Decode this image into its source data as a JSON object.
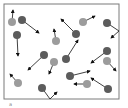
{
  "diagram": {
    "box": {
      "x": 4,
      "y": 4,
      "width": 115,
      "height": 95,
      "stroke": "#7a7a7a"
    },
    "colors": {
      "light_particle": "#9c9c9c",
      "dark_particle": "#5c5c5c",
      "arrow": "#111111"
    },
    "particle_radius": 4,
    "particles": [
      {
        "type": "light",
        "x": 12,
        "y": 22,
        "path": [
          [
            12,
            22
          ],
          [
            13,
            10
          ]
        ]
      },
      {
        "type": "dark",
        "x": 22,
        "y": 20,
        "path": [
          [
            22,
            20
          ],
          [
            39,
            33
          ]
        ]
      },
      {
        "type": "dark",
        "x": 17,
        "y": 35,
        "path": [
          [
            17,
            35
          ],
          [
            18,
            56
          ]
        ]
      },
      {
        "type": "light",
        "x": 56,
        "y": 41,
        "path": [
          [
            56,
            41
          ],
          [
            54,
            29
          ]
        ]
      },
      {
        "type": "light",
        "x": 83,
        "y": 22,
        "path": [
          [
            83,
            22
          ],
          [
            95,
            16
          ]
        ]
      },
      {
        "type": "dark",
        "x": 76,
        "y": 34,
        "path": [
          [
            76,
            34
          ],
          [
            61,
            19
          ]
        ]
      },
      {
        "type": "dark",
        "x": 107,
        "y": 23,
        "path": [
          [
            107,
            23
          ],
          [
            119,
            31
          ],
          [
            111,
            38
          ]
        ]
      },
      {
        "type": "dark",
        "x": 44,
        "y": 55,
        "path": [
          [
            44,
            55
          ],
          [
            28,
            70
          ]
        ]
      },
      {
        "type": "dark",
        "x": 66,
        "y": 59,
        "path": [
          [
            66,
            59
          ],
          [
            78,
            40
          ]
        ]
      },
      {
        "type": "light",
        "x": 54,
        "y": 62,
        "path": [
          [
            54,
            62
          ],
          [
            49,
            74
          ]
        ]
      },
      {
        "type": "dark",
        "x": 107,
        "y": 51,
        "path": [
          [
            107,
            51
          ],
          [
            91,
            63
          ]
        ]
      },
      {
        "type": "light",
        "x": 107,
        "y": 61,
        "path": [
          [
            107,
            61
          ],
          [
            116,
            71
          ]
        ]
      },
      {
        "type": "light",
        "x": 18,
        "y": 83,
        "path": [
          [
            18,
            83
          ],
          [
            10,
            74
          ]
        ]
      },
      {
        "type": "dark",
        "x": 70,
        "y": 76,
        "path": [
          [
            70,
            76
          ],
          [
            90,
            71
          ]
        ]
      },
      {
        "type": "light",
        "x": 87,
        "y": 84,
        "path": [
          [
            87,
            84
          ],
          [
            74,
            84
          ]
        ]
      },
      {
        "type": "dark",
        "x": 108,
        "y": 89,
        "path": [
          [
            108,
            89
          ],
          [
            91,
            78
          ]
        ]
      },
      {
        "type": "dark",
        "x": 42,
        "y": 88,
        "path": [
          [
            42,
            88
          ],
          [
            50,
            99
          ],
          [
            57,
            92
          ]
        ]
      }
    ],
    "caption": "a"
  }
}
